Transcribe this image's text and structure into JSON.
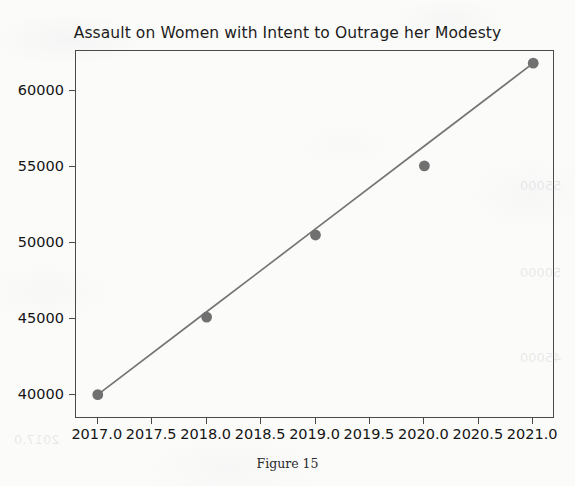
{
  "chart_data": {
    "type": "scatter",
    "title": "Assault on Women with Intent to Outrage her Modesty",
    "xlabel": "",
    "ylabel": "",
    "x": [
      2017,
      2018,
      2019,
      2020,
      2021
    ],
    "values": [
      40000,
      45100,
      50500,
      55050,
      61800
    ],
    "series": [
      {
        "name": "Reported cases",
        "type": "scatter",
        "values": [
          40000,
          45100,
          50500,
          55050,
          61800
        ]
      },
      {
        "name": "Trend line",
        "type": "line",
        "values": [
          40000,
          45450,
          50900,
          56350,
          61800
        ]
      }
    ],
    "xlim": [
      2016.8,
      2021.2
    ],
    "ylim": [
      38400,
      62600
    ],
    "xticks": [
      2017.0,
      2017.5,
      2018.0,
      2018.5,
      2019.0,
      2019.5,
      2020.0,
      2020.5,
      2021.0
    ],
    "xtick_labels": [
      "2017.0",
      "2017.5",
      "2018.0",
      "2018.5",
      "2019.0",
      "2019.5",
      "2020.0",
      "2020.5",
      "2021.0"
    ],
    "yticks": [
      40000,
      45000,
      50000,
      55000,
      60000
    ],
    "ytick_labels": [
      "40000",
      "45000",
      "50000",
      "55000",
      "60000"
    ],
    "grid": false,
    "legend": "none",
    "marker_color": "#707070",
    "line_color": "#757575",
    "axis_color": "#4a4a4a"
  },
  "caption": {
    "text": "Figure 15"
  },
  "bleed_through": {
    "left_mid": "2017.0",
    "right_upper": "55000",
    "right_mid": "50000",
    "right_lower": "45000"
  }
}
